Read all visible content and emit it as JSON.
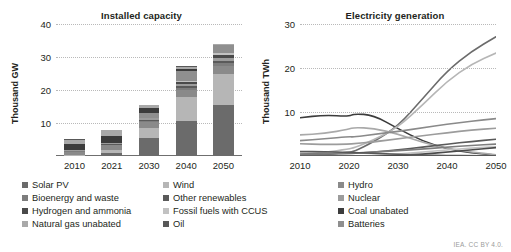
{
  "credit": "IEA. CC BY 4.0.",
  "panels": [
    {
      "id": "installed-capacity",
      "title": "Installed capacity",
      "ylabel": "Thousand GW"
    },
    {
      "id": "electricity-generation",
      "title": "Electricity generation",
      "ylabel": "Thousand TWh"
    }
  ],
  "legend": {
    "columns": [
      {
        "items": [
          {
            "label": "Solar PV",
            "color": "#6b6b6b"
          },
          {
            "label": "Bioenergy and waste",
            "color": "#7d7d7d"
          },
          {
            "label": "Hydrogen and ammonia",
            "color": "#4a4a4a"
          },
          {
            "label": "Natural gas unabated",
            "color": "#a9a9a9"
          }
        ]
      },
      {
        "items": [
          {
            "label": "Wind",
            "color": "#b6b6b6"
          },
          {
            "label": "Other renewables",
            "color": "#5a5a5a"
          },
          {
            "label": "Fossil fuels with CCUS",
            "color": "#c2c2c2"
          },
          {
            "label": "Oil",
            "color": "#585858"
          }
        ]
      },
      {
        "items": [
          {
            "label": "Hydro",
            "color": "#8a8a8a"
          },
          {
            "label": "Nuclear",
            "color": "#9c9c9c"
          },
          {
            "label": "Coal unabated",
            "color": "#3c3c3c"
          },
          {
            "label": "Batteries",
            "color": "#8f8f8f"
          }
        ]
      }
    ]
  },
  "chart_data": [
    {
      "type": "bar",
      "id": "installed-capacity",
      "title": "Installed capacity",
      "xlabel": "",
      "ylabel": "Thousand GW",
      "ylim": [
        0,
        40
      ],
      "yticks": [
        10,
        20,
        30,
        40
      ],
      "grid": true,
      "stacked": true,
      "categories": [
        "2010",
        "2021",
        "2030",
        "2040",
        "2050"
      ],
      "totals": [
        5.3,
        8.0,
        15.6,
        27.2,
        34.0
      ],
      "series": [
        {
          "name": "Solar PV",
          "color": "#6b6b6b",
          "values": [
            0.1,
            1.0,
            5.4,
            10.6,
            15.6
          ]
        },
        {
          "name": "Wind",
          "color": "#b6b6b6",
          "values": [
            0.2,
            0.9,
            3.1,
            7.2,
            9.4
          ]
        },
        {
          "name": "Hydro",
          "color": "#8a8a8a",
          "values": [
            1.0,
            1.3,
            1.7,
            2.1,
            2.4
          ]
        },
        {
          "name": "Bioenergy and waste",
          "color": "#7d7d7d",
          "values": [
            0.1,
            0.2,
            0.4,
            0.6,
            0.7
          ]
        },
        {
          "name": "Other renewables",
          "color": "#5a5a5a",
          "values": [
            0.1,
            0.1,
            0.3,
            0.6,
            0.8
          ]
        },
        {
          "name": "Nuclear",
          "color": "#9c9c9c",
          "values": [
            0.4,
            0.4,
            0.5,
            0.7,
            0.9
          ]
        },
        {
          "name": "Hydrogen and ammonia",
          "color": "#4a4a4a",
          "values": [
            0.0,
            0.0,
            0.1,
            0.5,
            0.9
          ]
        },
        {
          "name": "Fossil fuels with CCUS",
          "color": "#c2c2c2",
          "values": [
            0.0,
            0.0,
            0.1,
            0.4,
            0.6
          ]
        },
        {
          "name": "Batteries",
          "color": "#8f8f8f",
          "values": [
            0.0,
            0.1,
            1.4,
            3.0,
            2.4
          ]
        },
        {
          "name": "Coal unabated",
          "color": "#3c3c3c",
          "values": [
            1.7,
            2.2,
            1.5,
            0.7,
            0.1
          ]
        },
        {
          "name": "Natural gas unabated",
          "color": "#a9a9a9",
          "values": [
            1.4,
            1.7,
            1.0,
            0.7,
            0.2
          ]
        },
        {
          "name": "Oil",
          "color": "#585858",
          "values": [
            0.3,
            0.1,
            0.1,
            0.1,
            0.0
          ]
        }
      ]
    },
    {
      "type": "line",
      "id": "electricity-generation",
      "title": "Electricity generation",
      "xlabel": "",
      "ylabel": "Thousand TWh",
      "ylim": [
        0,
        30
      ],
      "yticks": [
        10,
        20,
        30
      ],
      "xlim": [
        2010,
        2050
      ],
      "xticks": [
        "2010",
        "2020",
        "2030",
        "2040",
        "2050"
      ],
      "grid": true,
      "x": [
        2010,
        2015,
        2020,
        2021,
        2025,
        2030,
        2035,
        2040,
        2045,
        2050
      ],
      "series": [
        {
          "name": "Coal unabated",
          "color": "#3c3c3c",
          "values": [
            8.7,
            9.3,
            9.0,
            9.6,
            9.3,
            6.2,
            3.4,
            1.6,
            0.7,
            0.2
          ]
        },
        {
          "name": "Solar PV",
          "color": "#6b6b6b",
          "values": [
            0.0,
            0.3,
            0.9,
            1.0,
            3.2,
            6.8,
            13.0,
            19.3,
            23.8,
            27.1
          ]
        },
        {
          "name": "Wind",
          "color": "#b6b6b6",
          "values": [
            0.4,
            0.8,
            1.6,
            1.9,
            3.6,
            6.5,
            11.6,
            17.0,
            20.9,
            23.4
          ]
        },
        {
          "name": "Natural gas unabated",
          "color": "#a9a9a9",
          "values": [
            4.8,
            5.1,
            6.1,
            6.5,
            6.3,
            5.0,
            3.1,
            1.7,
            0.9,
            0.3
          ]
        },
        {
          "name": "Hydro",
          "color": "#8a8a8a",
          "values": [
            3.5,
            3.9,
            4.4,
            4.3,
            4.9,
            5.6,
            6.4,
            7.2,
            7.9,
            8.5
          ]
        },
        {
          "name": "Nuclear",
          "color": "#9c9c9c",
          "values": [
            2.8,
            2.6,
            2.7,
            2.8,
            3.2,
            3.9,
            4.6,
            5.3,
            5.9,
            6.3
          ]
        },
        {
          "name": "Other renewables",
          "color": "#5a5a5a",
          "values": [
            0.4,
            0.5,
            0.6,
            0.6,
            0.9,
            1.4,
            2.0,
            2.7,
            3.3,
            3.8
          ]
        },
        {
          "name": "Bioenergy and waste",
          "color": "#7d7d7d",
          "values": [
            0.4,
            0.5,
            0.7,
            0.7,
            0.9,
            1.2,
            1.6,
            2.0,
            2.4,
            2.7
          ]
        },
        {
          "name": "Fossil fuels with CCUS",
          "color": "#c2c2c2",
          "values": [
            0.0,
            0.0,
            0.0,
            0.0,
            0.1,
            0.4,
            0.9,
            1.4,
            1.8,
            2.1
          ]
        },
        {
          "name": "Hydrogen and ammonia",
          "color": "#4a4a4a",
          "values": [
            0.0,
            0.0,
            0.0,
            0.0,
            0.0,
            0.1,
            0.4,
            0.9,
            1.4,
            1.9
          ]
        },
        {
          "name": "Oil",
          "color": "#585858",
          "values": [
            1.0,
            1.0,
            0.8,
            0.8,
            0.6,
            0.4,
            0.2,
            0.1,
            0.1,
            0.0
          ]
        }
      ]
    }
  ]
}
